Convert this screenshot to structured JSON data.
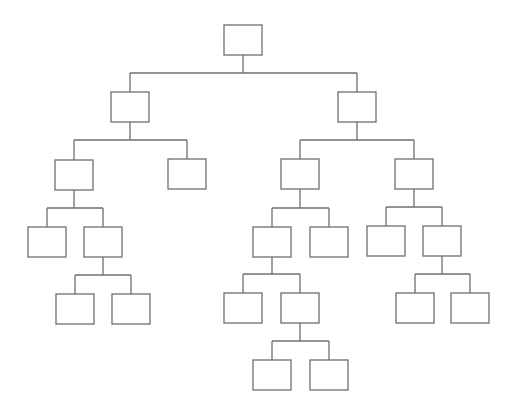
{
  "diagram": {
    "type": "tree",
    "stroke_color": "#6f6f6f",
    "background": "#ffffff",
    "box_width": 38,
    "box_height": 30,
    "nodes": [
      {
        "id": "root",
        "x": 224,
        "y": 25,
        "label": ""
      },
      {
        "id": "L",
        "x": 111,
        "y": 92,
        "label": ""
      },
      {
        "id": "R",
        "x": 338,
        "y": 92,
        "label": ""
      },
      {
        "id": "LL",
        "x": 55,
        "y": 160,
        "label": ""
      },
      {
        "id": "LR",
        "x": 168,
        "y": 159,
        "label": ""
      },
      {
        "id": "RL",
        "x": 281,
        "y": 159,
        "label": ""
      },
      {
        "id": "RR",
        "x": 395,
        "y": 159,
        "label": ""
      },
      {
        "id": "LLL",
        "x": 28,
        "y": 227,
        "label": ""
      },
      {
        "id": "LLR",
        "x": 84,
        "y": 227,
        "label": ""
      },
      {
        "id": "RLL",
        "x": 253,
        "y": 227,
        "label": ""
      },
      {
        "id": "RLR",
        "x": 310,
        "y": 227,
        "label": ""
      },
      {
        "id": "RRL",
        "x": 367,
        "y": 226,
        "label": ""
      },
      {
        "id": "RRR",
        "x": 423,
        "y": 226,
        "label": ""
      },
      {
        "id": "LLRL",
        "x": 56,
        "y": 294,
        "label": ""
      },
      {
        "id": "LLRR",
        "x": 112,
        "y": 294,
        "label": ""
      },
      {
        "id": "RLLL",
        "x": 224,
        "y": 293,
        "label": ""
      },
      {
        "id": "RLLR",
        "x": 281,
        "y": 293,
        "label": ""
      },
      {
        "id": "RRRL",
        "x": 396,
        "y": 293,
        "label": ""
      },
      {
        "id": "RRRR",
        "x": 451,
        "y": 293,
        "label": ""
      },
      {
        "id": "RLLRL",
        "x": 253,
        "y": 360,
        "label": ""
      },
      {
        "id": "RLLRR",
        "x": 310,
        "y": 360,
        "label": ""
      }
    ],
    "edges": [
      {
        "parent": "root",
        "children": [
          "L",
          "R"
        ],
        "bar_y": 73
      },
      {
        "parent": "L",
        "children": [
          "LL",
          "LR"
        ],
        "bar_y": 140
      },
      {
        "parent": "R",
        "children": [
          "RL",
          "RR"
        ],
        "bar_y": 140
      },
      {
        "parent": "LL",
        "children": [
          "LLL",
          "LLR"
        ],
        "bar_y": 208
      },
      {
        "parent": "RL",
        "children": [
          "RLL",
          "RLR"
        ],
        "bar_y": 208
      },
      {
        "parent": "RR",
        "children": [
          "RRL",
          "RRR"
        ],
        "bar_y": 207
      },
      {
        "parent": "LLR",
        "children": [
          "LLRL",
          "LLRR"
        ],
        "bar_y": 275
      },
      {
        "parent": "RLL",
        "children": [
          "RLLL",
          "RLLR"
        ],
        "bar_y": 274
      },
      {
        "parent": "RRR",
        "children": [
          "RRRL",
          "RRRR"
        ],
        "bar_y": 274
      },
      {
        "parent": "RLLR",
        "children": [
          "RLLRL",
          "RLLRR"
        ],
        "bar_y": 341
      }
    ]
  }
}
